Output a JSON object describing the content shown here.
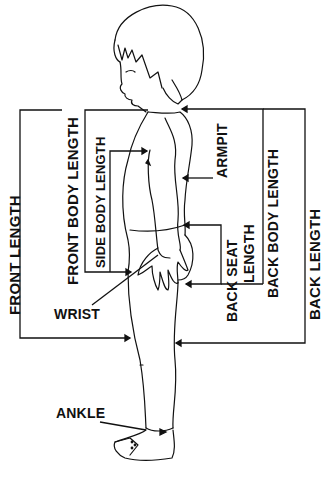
{
  "diagram": {
    "labels": {
      "front_length": "FRONT LENGTH",
      "front_body_length": "FRONT BODY LENGTH",
      "side_body_length": "SIDE BODY LENGTH",
      "armpit": "ARMPIT",
      "back_seat_length_line1": "BACK SEAT",
      "back_seat_length_line2": "LENGTH",
      "back_body_length": "BACK BODY  LENGTH",
      "back_length": "BACK LENGTH",
      "wrist": "WRIST",
      "ankle": "ANKLE"
    },
    "colors": {
      "ink": "#111111",
      "background": "#ffffff"
    }
  }
}
